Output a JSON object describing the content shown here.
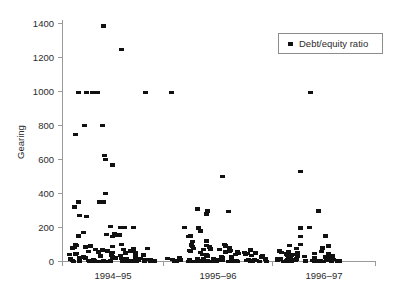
{
  "chart": {
    "type": "scatter",
    "title": "",
    "ylabel": "Gearing",
    "xlabel": "",
    "legend_label": "Debt/equity ratio",
    "legend_position": "top-right",
    "grid": false,
    "marker_color": "#111111",
    "axis_color": "#9a9a9a",
    "yticks": [
      "0",
      "200",
      "400",
      "600",
      "800",
      "1000",
      "1200",
      "1400"
    ],
    "xticks": [
      "1994–95",
      "1995–96",
      "1996–97"
    ]
  },
  "chart_data": {
    "type": "scatter",
    "title": "",
    "xlabel": "",
    "ylabel": "Gearing",
    "ylim": [
      0,
      1400
    ],
    "ytick_values": [
      0,
      200,
      400,
      600,
      800,
      1000,
      1200,
      1400
    ],
    "grid": false,
    "legend_position": "top-right",
    "categories": [
      "1994–95",
      "1995–96",
      "1996–97"
    ],
    "series": [
      {
        "name": "Debt/equity ratio",
        "marker": "square",
        "color": "#111111",
        "groups": [
          {
            "category": "1994–95",
            "values": [
              1385,
              1248,
              995,
              995,
              995,
              995,
              995,
              800,
              800,
              748,
              625,
              600,
              568,
              400,
              350,
              350,
              350,
              320,
              272,
              265,
              205,
              200,
              200,
              170,
              165,
              160,
              155,
              152,
              150,
              148,
              100,
              98,
              95,
              90,
              88,
              85,
              82,
              80,
              78,
              75,
              72,
              70,
              68,
              65,
              62,
              60,
              58,
              56,
              54,
              52,
              50,
              48,
              46,
              44,
              42,
              40,
              38,
              36,
              35,
              34,
              32,
              30,
              28,
              26,
              25,
              24,
              22,
              20,
              19,
              18,
              17,
              16,
              15,
              14,
              13,
              12,
              11,
              10,
              9,
              8,
              7,
              6,
              5,
              5,
              4,
              4,
              3,
              3,
              2,
              2,
              2,
              1,
              1,
              1,
              1,
              0,
              0,
              0,
              0,
              0,
              0,
              0,
              0,
              0,
              0
            ]
          },
          {
            "category": "1995–96",
            "values": [
              995,
              500,
              310,
              298,
              295,
              280,
              200,
              198,
              180,
              150,
              148,
              120,
              118,
              100,
              98,
              95,
              90,
              88,
              85,
              80,
              78,
              75,
              72,
              70,
              68,
              66,
              64,
              62,
              60,
              58,
              56,
              54,
              52,
              50,
              48,
              46,
              44,
              42,
              40,
              38,
              36,
              34,
              32,
              30,
              28,
              26,
              24,
              22,
              20,
              19,
              18,
              17,
              16,
              15,
              14,
              13,
              12,
              11,
              10,
              9,
              8,
              7,
              6,
              5,
              5,
              4,
              4,
              3,
              3,
              2,
              2,
              2,
              1,
              1,
              1,
              1,
              0,
              0,
              0,
              0,
              0,
              0,
              0,
              0,
              0,
              0,
              0,
              0,
              0,
              0
            ]
          },
          {
            "category": "1996–97",
            "values": [
              995,
              530,
              298,
              200,
              198,
              150,
              148,
              100,
              95,
              90,
              80,
              78,
              62,
              60,
              58,
              52,
              50,
              48,
              46,
              44,
              42,
              40,
              38,
              36,
              34,
              32,
              30,
              28,
              26,
              25,
              24,
              22,
              20,
              19,
              18,
              17,
              16,
              15,
              14,
              13,
              12,
              11,
              10,
              9,
              8,
              7,
              6,
              5,
              5,
              4,
              4,
              3,
              3,
              2,
              2,
              2,
              1,
              1,
              1,
              1,
              0,
              0,
              0,
              0,
              0,
              0,
              0,
              0,
              0,
              0
            ]
          }
        ]
      }
    ],
    "points": [
      {
        "group": "1994–95",
        "x_px": 103,
        "y": 1385
      },
      {
        "group": "1994–95",
        "x_px": 121,
        "y": 1248
      },
      {
        "group": "1994–95",
        "x_px": 78,
        "y": 995
      },
      {
        "group": "1994–95",
        "x_px": 86,
        "y": 995
      },
      {
        "group": "1994–95",
        "x_px": 92,
        "y": 995
      },
      {
        "group": "1994–95",
        "x_px": 97,
        "y": 995
      },
      {
        "group": "1994–95",
        "x_px": 145,
        "y": 995
      },
      {
        "group": "1994–95",
        "x_px": 84,
        "y": 800
      },
      {
        "group": "1994–95",
        "x_px": 102,
        "y": 800
      },
      {
        "group": "1994–95",
        "x_px": 75,
        "y": 748
      },
      {
        "group": "1994–95",
        "x_px": 104,
        "y": 625
      },
      {
        "group": "1994–95",
        "x_px": 105,
        "y": 600
      },
      {
        "group": "1994–95",
        "x_px": 112,
        "y": 568
      },
      {
        "group": "1994–95",
        "x_px": 105,
        "y": 400
      },
      {
        "group": "1994–95",
        "x_px": 78,
        "y": 350
      },
      {
        "group": "1994–95",
        "x_px": 99,
        "y": 350
      },
      {
        "group": "1994–95",
        "x_px": 103,
        "y": 350
      },
      {
        "group": "1994–95",
        "x_px": 74,
        "y": 320
      },
      {
        "group": "1994–95",
        "x_px": 79,
        "y": 272
      },
      {
        "group": "1994–95",
        "x_px": 86,
        "y": 265
      },
      {
        "group": "1994–95",
        "x_px": 110,
        "y": 205
      },
      {
        "group": "1994–95",
        "x_px": 120,
        "y": 200
      },
      {
        "group": "1995–96",
        "x_px": 197,
        "y": 310
      },
      {
        "group": "1995–96",
        "x_px": 207,
        "y": 298
      },
      {
        "group": "1995–96",
        "x_px": 228,
        "y": 295
      },
      {
        "group": "1995–96",
        "x_px": 206,
        "y": 280
      },
      {
        "group": "1995–96",
        "x_px": 222,
        "y": 500
      },
      {
        "group": "1995–96",
        "x_px": 171,
        "y": 995
      },
      {
        "group": "1996–97",
        "x_px": 300,
        "y": 530
      },
      {
        "group": "1996–97",
        "x_px": 310,
        "y": 995
      },
      {
        "group": "1996–97",
        "x_px": 318,
        "y": 298
      }
    ],
    "annotations": []
  },
  "legend": {
    "label": "Debt/equity ratio",
    "marker_shape": "square"
  }
}
